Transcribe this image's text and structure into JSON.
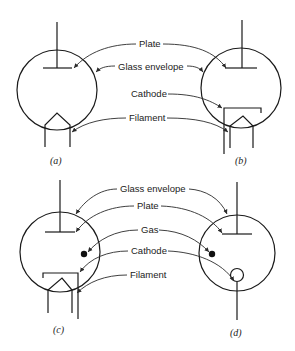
{
  "figure": {
    "panels": [
      {
        "id": "a",
        "caption": "(a)"
      },
      {
        "id": "b",
        "caption": "(b)"
      },
      {
        "id": "c",
        "caption": "(c)"
      },
      {
        "id": "d",
        "caption": "(d)"
      }
    ],
    "top_labels": {
      "plate": "Plate",
      "glass_envelope": "Glass envelope",
      "cathode": "Cathode",
      "filament": "Filament"
    },
    "bottom_labels": {
      "glass_envelope": "Glass envelope",
      "plate": "Plate",
      "gas": "Gas",
      "cathode": "Cathode",
      "filament": "Filament"
    },
    "colors": {
      "line": "#1a1a1a",
      "background": "#ffffff"
    }
  }
}
